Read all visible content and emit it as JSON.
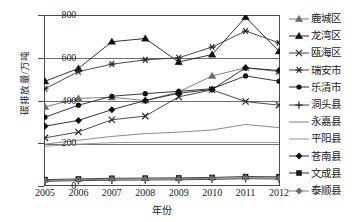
{
  "chart_data": {
    "type": "line",
    "title": "",
    "xlabel": "年份",
    "ylabel": "碳排放量/万吨",
    "x": [
      "2005",
      "2006",
      "2007",
      "2008",
      "2009",
      "2010",
      "2011",
      "2012"
    ],
    "xtick_labels": [
      "2005",
      "2006",
      "2007",
      "2008",
      "2009",
      "2010",
      "2011",
      "2012"
    ],
    "ytick_labels": [
      "0",
      "200",
      "400",
      "600",
      "800"
    ],
    "yticks": [
      0,
      200,
      400,
      600,
      800
    ],
    "ylim": [
      0,
      800
    ],
    "grid": "horizontal",
    "legend_position": "right",
    "series": [
      {
        "name": "鹿城区",
        "marker": "triangle-gray",
        "color": "#6b6b6b",
        "values": [
          370,
          410,
          415,
          400,
          440,
          515,
          553,
          535
        ]
      },
      {
        "name": "龙湾区",
        "marker": "triangle-black",
        "color": "#111111",
        "values": [
          490,
          550,
          675,
          690,
          580,
          615,
          790,
          630
        ]
      },
      {
        "name": "瓯海区",
        "marker": "x-cross",
        "color": "#2b2b2b",
        "values": [
          225,
          253,
          310,
          327,
          417,
          450,
          395,
          378
        ]
      },
      {
        "name": "瑞安市",
        "marker": "asterisk",
        "color": "#2b2b2b",
        "values": [
          455,
          535,
          570,
          590,
          600,
          650,
          725,
          670
        ]
      },
      {
        "name": "乐清市",
        "marker": "circle",
        "color": "#141414",
        "values": [
          322,
          378,
          420,
          432,
          443,
          455,
          515,
          490
        ]
      },
      {
        "name": "洞头县",
        "marker": "plus",
        "color": "#2b2b2b",
        "values": [
          22,
          25,
          27,
          28,
          29,
          31,
          34,
          33
        ]
      },
      {
        "name": "永嘉县",
        "marker": "line",
        "color": "#8a8a8a",
        "values": [
          196,
          214,
          232,
          245,
          252,
          262,
          288,
          273
        ]
      },
      {
        "name": "平阳县",
        "marker": "line",
        "color": "#9a9a9a",
        "values": [
          186,
          196,
          203,
          204,
          204,
          204,
          204,
          204
        ]
      },
      {
        "name": "苍南县",
        "marker": "diamond-black",
        "color": "#111111",
        "values": [
          280,
          307,
          357,
          400,
          434,
          452,
          553,
          540
        ]
      },
      {
        "name": "文成县",
        "marker": "square",
        "color": "#1a1a1a",
        "values": [
          30,
          33,
          36,
          37,
          38,
          40,
          44,
          43
        ]
      },
      {
        "name": "泰顺县",
        "marker": "diamond-gray",
        "color": "#6b6b6b",
        "values": [
          26,
          29,
          32,
          33,
          34,
          36,
          39,
          38
        ]
      }
    ]
  },
  "legend": {
    "items": [
      {
        "label": "鹿城区",
        "marker": "triangle-gray"
      },
      {
        "label": "龙湾区",
        "marker": "triangle-black"
      },
      {
        "label": "瓯海区",
        "marker": "x-cross"
      },
      {
        "label": "瑞安市",
        "marker": "asterisk"
      },
      {
        "label": "乐清市",
        "marker": "circle"
      },
      {
        "label": "洞头县",
        "marker": "plus"
      },
      {
        "label": "永嘉县",
        "marker": "line"
      },
      {
        "label": "平阳县",
        "marker": "line"
      },
      {
        "label": "苍南县",
        "marker": "diamond-black"
      },
      {
        "label": "文成县",
        "marker": "square"
      },
      {
        "label": "泰顺县",
        "marker": "diamond-gray"
      }
    ]
  },
  "caption": {
    "text": ""
  }
}
